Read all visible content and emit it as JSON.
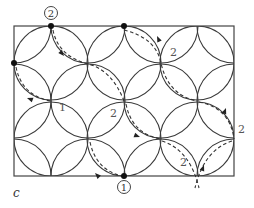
{
  "figure": {
    "caption": "c",
    "frame": {
      "x": 14,
      "y": 26,
      "w": 220,
      "h": 150
    },
    "radius": 37,
    "centers": [
      [
        51,
        63
      ],
      [
        124,
        63
      ],
      [
        197,
        63
      ],
      [
        51,
        139
      ],
      [
        124,
        139
      ],
      [
        197,
        139
      ],
      [
        14,
        26
      ],
      [
        88,
        26
      ],
      [
        161,
        26
      ],
      [
        234,
        26
      ],
      [
        14,
        101
      ],
      [
        88,
        101
      ],
      [
        161,
        101
      ],
      [
        234,
        101
      ],
      [
        14,
        176
      ],
      [
        88,
        176
      ],
      [
        161,
        176
      ],
      [
        234,
        176
      ]
    ],
    "dots": [
      [
        51,
        26
      ],
      [
        14,
        63
      ],
      [
        124,
        26
      ],
      [
        124,
        176
      ]
    ],
    "markers": [
      {
        "label": "2",
        "x": 51,
        "y": 13
      },
      {
        "label": "1",
        "x": 124,
        "y": 187
      }
    ],
    "edge_labels": [
      {
        "text": "1",
        "x": 59,
        "y": 111
      },
      {
        "text": "2",
        "x": 170,
        "y": 56
      },
      {
        "text": "2",
        "x": 110,
        "y": 117
      },
      {
        "text": "2",
        "x": 238,
        "y": 133
      },
      {
        "text": "2",
        "x": 180,
        "y": 166
      }
    ],
    "dashed_paths": [
      "M53,30 Q58,56 88,64 Q112,70 124,101",
      "M16,67 Q22,96 51,101",
      "M124,30 Q156,38 161,63 Q168,95 197,101",
      "M126,104 Q132,134 161,139",
      "M90,142 Q96,170 122,176",
      "M199,102 Q230,108 234,139",
      "M162,141 Q190,150 199,188",
      "M232,141 Q204,150 195,188"
    ],
    "arrows": [
      {
        "x": 64,
        "y": 56,
        "angle": 50
      },
      {
        "x": 27,
        "y": 98,
        "angle": 200
      },
      {
        "x": 157,
        "y": 36,
        "angle": 245
      },
      {
        "x": 140,
        "y": 137,
        "angle": 20
      },
      {
        "x": 95,
        "y": 173,
        "angle": 225
      },
      {
        "x": 226,
        "y": 108,
        "angle": 290
      },
      {
        "x": 204,
        "y": 165,
        "angle": 290
      }
    ]
  }
}
